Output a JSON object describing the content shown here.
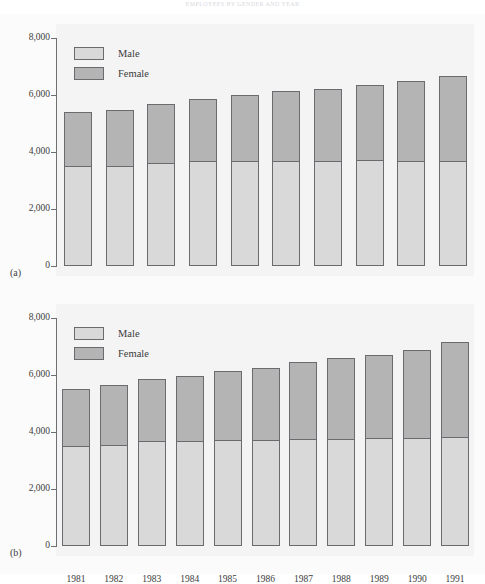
{
  "top_caption": "EMPLOYEES BY GENDER AND YEAR",
  "legend": {
    "male_label": "Male",
    "female_label": "Female",
    "male_color": "#d9d9d9",
    "female_color": "#b4b4b4"
  },
  "axis": {
    "tick_labels": [
      "8,000",
      "6,000",
      "4,000",
      "2,000",
      "0"
    ],
    "tick_values": [
      8000,
      6000,
      4000,
      2000,
      0
    ]
  },
  "panels": [
    {
      "tag": "(a)",
      "name": "chart-a"
    },
    {
      "tag": "(b)",
      "name": "chart-b"
    }
  ],
  "chart_data": [
    {
      "type": "bar",
      "id": "a",
      "title": "(a)",
      "stacked": true,
      "xlabel": "",
      "ylabel": "",
      "ylim": [
        0,
        8000
      ],
      "yticks": [
        0,
        2000,
        4000,
        6000,
        8000
      ],
      "grid": false,
      "legend_position": "top-left",
      "categories": [
        "1980",
        "1981",
        "1982",
        "1983",
        "1984",
        "1985",
        "1986",
        "1987",
        "1988",
        "1989"
      ],
      "series": [
        {
          "name": "Male",
          "color": "#d9d9d9",
          "values": [
            3500,
            3500,
            3620,
            3680,
            3700,
            3700,
            3700,
            3720,
            3700,
            3700
          ]
        },
        {
          "name": "Female",
          "color": "#b4b4b4",
          "values": [
            1950,
            2020,
            2100,
            2220,
            2320,
            2460,
            2540,
            2680,
            2840,
            2990
          ]
        }
      ],
      "totals": [
        5450,
        5520,
        5720,
        5900,
        6020,
        6160,
        6240,
        6400,
        6540,
        6690
      ]
    },
    {
      "type": "bar",
      "id": "b",
      "title": "(b)",
      "stacked": true,
      "xlabel": "",
      "ylabel": "",
      "ylim": [
        0,
        8000
      ],
      "yticks": [
        0,
        2000,
        4000,
        6000,
        8000
      ],
      "grid": false,
      "legend_position": "top-left",
      "categories": [
        "1981",
        "1982",
        "1983",
        "1984",
        "1985",
        "1986",
        "1987",
        "1988",
        "1989",
        "1990",
        "1991"
      ],
      "series": [
        {
          "name": "Male",
          "color": "#d9d9d9",
          "values": [
            3520,
            3560,
            3680,
            3700,
            3720,
            3720,
            3740,
            3760,
            3780,
            3800,
            3820
          ]
        },
        {
          "name": "Female",
          "color": "#b4b4b4",
          "values": [
            2010,
            2130,
            2210,
            2310,
            2470,
            2570,
            2740,
            2860,
            2970,
            3110,
            3370
          ]
        }
      ],
      "totals": [
        5530,
        5690,
        5890,
        6010,
        6190,
        6290,
        6480,
        6620,
        6750,
        6910,
        7190
      ]
    }
  ]
}
